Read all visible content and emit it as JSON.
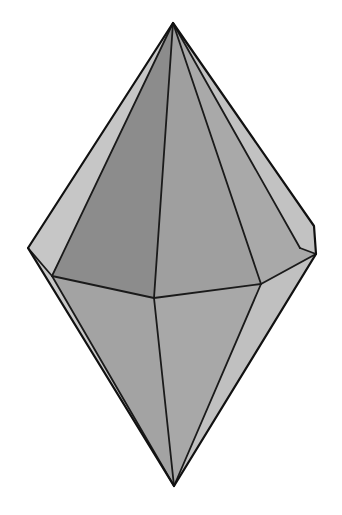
{
  "figure": {
    "background_color": "#ffffff",
    "edge_color": "#1a1a1a",
    "face_shades": {
      "upper_left_light": "#c6c6c6",
      "upper_left_dark": "#8c8c8c",
      "upper_center": "#9f9f9f",
      "upper_right": "#a9a9a9",
      "upper_right_light": "#c2c2c2",
      "lower_left_sliver": "#c8c8c8",
      "lower_left": "#a3a3a3",
      "lower_center": "#a8a8a8",
      "lower_right_light": "#c0c0c0"
    }
  }
}
